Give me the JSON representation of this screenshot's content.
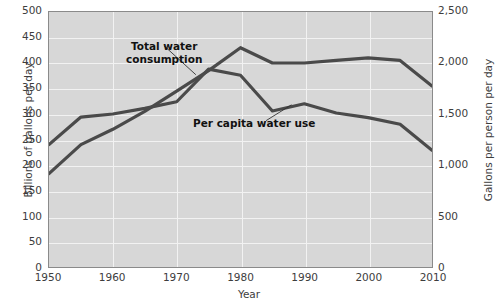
{
  "chart_data": {
    "type": "line",
    "title": "",
    "xlabel": "Year",
    "ylabel": "Billions of gallons per day",
    "ylabel_right": "Gallons per person per day",
    "x": [
      1950,
      1955,
      1960,
      1965,
      1970,
      1975,
      1980,
      1985,
      1990,
      1995,
      2000,
      2005,
      2010
    ],
    "xlim": [
      1950,
      2010
    ],
    "ylim": [
      0,
      500
    ],
    "ylim_right": [
      0,
      2500
    ],
    "yticks": [
      0,
      50,
      100,
      150,
      200,
      250,
      300,
      350,
      400,
      450,
      500
    ],
    "yticks_right": [
      "0",
      "500",
      "1,000",
      "1,500",
      "2,000",
      "2,500"
    ],
    "yticks_right_values": [
      0,
      500,
      1000,
      1500,
      2000,
      2500
    ],
    "xticks": [
      1950,
      1960,
      1970,
      1980,
      1990,
      2000,
      2010
    ],
    "grid": true,
    "legend_position": "inline-annotations",
    "series": [
      {
        "name": "Total water consumption",
        "axis": "left",
        "unit": "Billions of gallons per day",
        "color": "#4a4a4a",
        "values": [
          183,
          240,
          270,
          305,
          345,
          385,
          430,
          400,
          400,
          405,
          410,
          405,
          355
        ]
      },
      {
        "name": "Per capita water use",
        "axis": "right",
        "unit": "Gallons per person per day",
        "color": "#4a4a4a",
        "values_right_axis": [
          1200,
          1470,
          1500,
          1555,
          1620,
          1940,
          1880,
          1530,
          1600,
          1510,
          1465,
          1400,
          1145
        ],
        "values_left_equivalent": [
          240,
          294,
          300,
          311,
          324,
          388,
          376,
          306,
          320,
          302,
          293,
          280,
          229
        ]
      }
    ],
    "annotations": [
      {
        "name": "total-water-consumption",
        "text": "Total water\nconsumption",
        "x": 1970,
        "y": 448
      },
      {
        "name": "per-capita-water-use",
        "text": "Per capita water use",
        "x": 1981,
        "y": 268
      }
    ]
  },
  "axes": {
    "left": {
      "title": "Billions of gallons per day",
      "ticks": [
        "500",
        "450",
        "400",
        "350",
        "300",
        "250",
        "200",
        "150",
        "100",
        "50",
        "0"
      ]
    },
    "right": {
      "title": "Gallons per person per day",
      "ticks": [
        "2,500",
        "2,000",
        "1,500",
        "1,000",
        "500",
        "0"
      ]
    },
    "bottom": {
      "title": "Year",
      "ticks": [
        "1950",
        "1960",
        "1970",
        "1980",
        "1990",
        "2000",
        "2010"
      ]
    }
  }
}
